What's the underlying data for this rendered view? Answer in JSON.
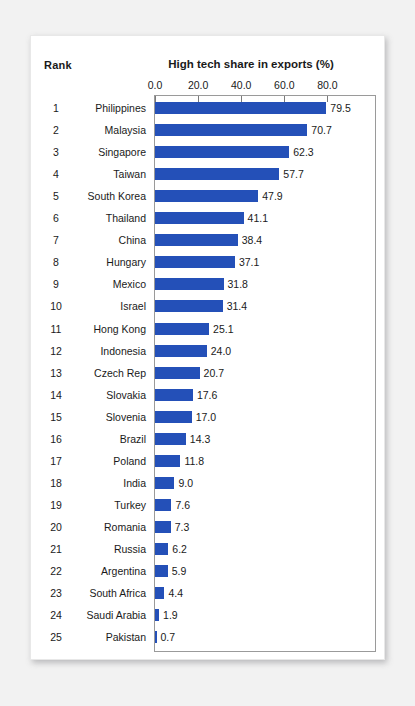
{
  "header": {
    "rank_label": "Rank",
    "title": "High tech share in exports (%)"
  },
  "colors": {
    "bar": "#2450b8",
    "card": "#ffffff",
    "page_background": "#f2f2f2",
    "frame": "#9a9a9a",
    "text": "#1a1a1a"
  },
  "chart_data": {
    "type": "bar",
    "orientation": "horizontal",
    "title": "High tech share in exports (%)",
    "xlabel": "",
    "ylabel": "",
    "xlim": [
      0,
      93
    ],
    "xticks": [
      "0.0",
      "20.0",
      "40.0",
      "60.0",
      "80.0"
    ],
    "xtick_values": [
      0,
      20,
      40,
      60,
      80
    ],
    "grid": false,
    "legend": false,
    "rank_header": "Rank",
    "ranks": [
      1,
      2,
      3,
      4,
      5,
      6,
      7,
      8,
      9,
      10,
      11,
      12,
      13,
      14,
      15,
      16,
      17,
      18,
      19,
      20,
      21,
      22,
      23,
      24,
      25
    ],
    "categories": [
      "Philippines",
      "Malaysia",
      "Singapore",
      "Taiwan",
      "South Korea",
      "Thailand",
      "China",
      "Hungary",
      "Mexico",
      "Israel",
      "Hong Kong",
      "Indonesia",
      "Czech Rep",
      "Slovakia",
      "Slovenia",
      "Brazil",
      "Poland",
      "India",
      "Turkey",
      "Romania",
      "Russia",
      "Argentina",
      "South Africa",
      "Saudi Arabia",
      "Pakistan"
    ],
    "values": [
      79.5,
      70.7,
      62.3,
      57.7,
      47.9,
      41.1,
      38.4,
      37.1,
      31.8,
      31.4,
      25.1,
      24.0,
      20.7,
      17.6,
      17.0,
      14.3,
      11.8,
      9.0,
      7.6,
      7.3,
      6.2,
      5.9,
      4.4,
      1.9,
      0.7
    ],
    "value_labels": [
      "79.5",
      "70.7",
      "62.3",
      "57.7",
      "47.9",
      "41.1",
      "38.4",
      "37.1",
      "31.8",
      "31.4",
      "25.1",
      "24.0",
      "20.7",
      "17.6",
      "17.0",
      "14.3",
      "11.8",
      "9.0",
      "7.6",
      "7.3",
      "6.2",
      "5.9",
      "4.4",
      "1.9",
      "0.7"
    ]
  }
}
